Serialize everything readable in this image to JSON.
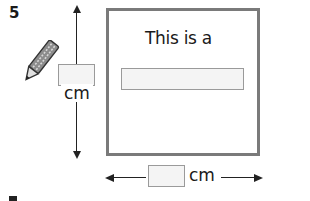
{
  "question": {
    "number": "5"
  },
  "vertical_dimension": {
    "unit_label": "cm",
    "input_value": ""
  },
  "horizontal_dimension": {
    "unit_label": "cm",
    "input_value": ""
  },
  "shape": {
    "prompt_text": "This is a",
    "answer_value": ""
  },
  "icons": {
    "pencil": "pencil-icon"
  },
  "colors": {
    "shape_border": "#7a7a7a",
    "input_fill": "#f4f4f4",
    "input_border": "#9a9a9a",
    "ink": "#1a1a1a"
  }
}
